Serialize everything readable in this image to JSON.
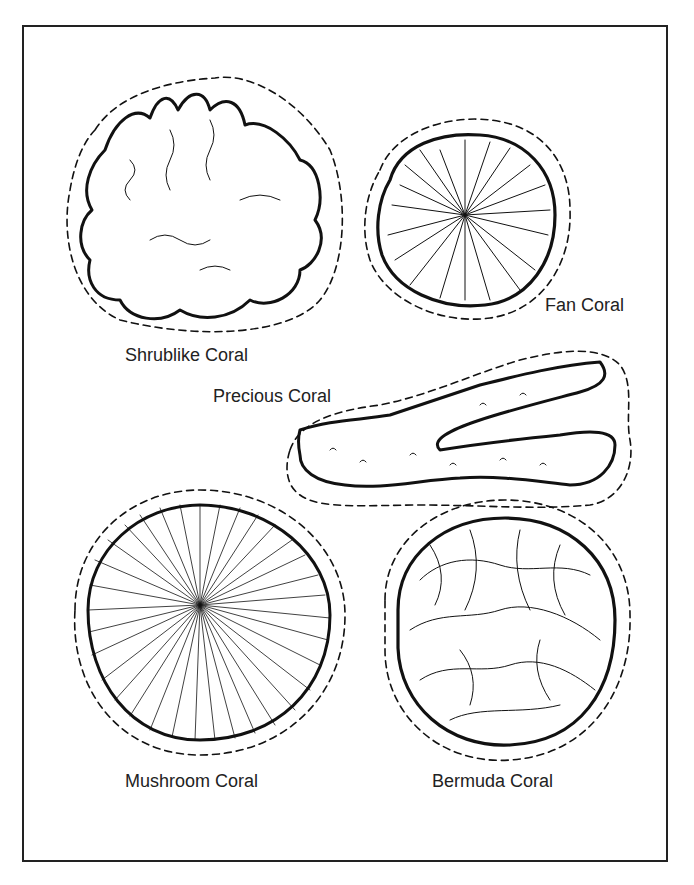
{
  "page": {
    "type": "coloring-page",
    "border_color": "#222222",
    "background": "#ffffff"
  },
  "corals": [
    {
      "id": "shrublike",
      "label": "Shrublike Coral"
    },
    {
      "id": "fan",
      "label": "Fan Coral"
    },
    {
      "id": "precious",
      "label": "Precious Coral"
    },
    {
      "id": "mushroom",
      "label": "Mushroom Coral"
    },
    {
      "id": "bermuda",
      "label": "Bermuda Coral"
    }
  ]
}
